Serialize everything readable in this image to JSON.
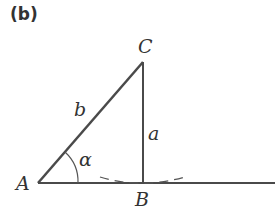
{
  "panel_label": "(b)",
  "vertices": {
    "A": "A",
    "B": "B",
    "C": "C"
  },
  "sides": {
    "b": "b",
    "a": "a"
  },
  "angle": "α",
  "colors": {
    "stroke": "#4a4a4a",
    "text": "#333333"
  }
}
